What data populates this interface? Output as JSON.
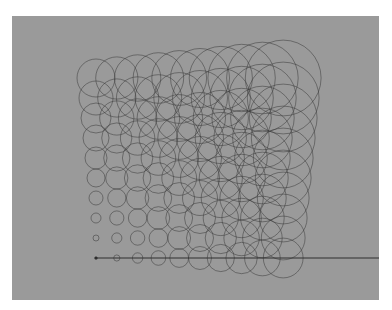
{
  "figure": {
    "panel": {
      "x": 12,
      "y": 16,
      "width": 367,
      "height": 284,
      "color": "#9a9a9a"
    },
    "stroke_color": "#3a3a3a",
    "baseline": {
      "x1": 95,
      "y1": 258,
      "x2": 379,
      "y2": 258,
      "color": "#2e2e2e"
    },
    "grid": {
      "columns": 10,
      "rows": 10,
      "origin_x": 96,
      "origin_y": 258,
      "col_spacing": 20.8,
      "row_spacing": 20,
      "base_radius": 1,
      "radius_step_x": 2.1,
      "radius_step_y": 2.0
    },
    "corner_radii": {
      "bottom_left": 1,
      "bottom_right": 20,
      "top_left": 19,
      "top_right": 39
    }
  }
}
